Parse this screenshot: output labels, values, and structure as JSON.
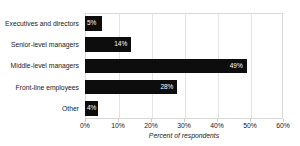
{
  "chart_data": {
    "type": "bar",
    "orientation": "horizontal",
    "title": "",
    "categories": [
      "Executives and directors",
      "Senior-level managers",
      "Middle-level managers",
      "Front-line employees",
      "Other"
    ],
    "values": [
      5,
      14,
      49,
      28,
      4
    ],
    "data_labels": [
      "5%",
      "14%",
      "49%",
      "28%",
      "4%"
    ],
    "xlabel": "Percent of respondents",
    "ylabel": "",
    "xlim": [
      0,
      60
    ],
    "xticks": [
      0,
      10,
      20,
      30,
      40,
      50,
      60
    ],
    "xtick_labels": [
      "0%",
      "10%",
      "20%",
      "30%",
      "40%",
      "50%",
      "60%"
    ],
    "grid": "vertical",
    "legend": "none",
    "bar_color": "#0d0d0d",
    "label_color": "#ffffff",
    "gridline_color": "#e4e4e4",
    "border_color": "#d8d8d8",
    "background_color": "#ffffff"
  }
}
